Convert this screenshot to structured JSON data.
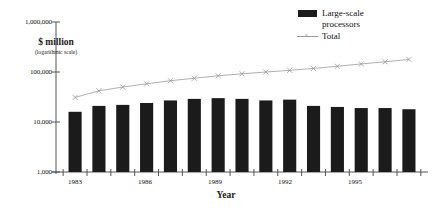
{
  "chart_data": {
    "type": "bar",
    "title": "",
    "xlabel": "Year",
    "ylabel": "$ million",
    "ylabel_note": "(logarithmic scale)",
    "scale": "logarithmic",
    "ylim": [
      1000,
      1000000
    ],
    "ytick_labels": [
      "1,000,000",
      "100,000",
      "10,000",
      "1,000"
    ],
    "ytick_values": [
      1000000,
      100000,
      10000,
      1000
    ],
    "grid": false,
    "legend_position": "top-right",
    "categories": [
      "1983",
      "1984",
      "1985",
      "1986",
      "1987",
      "1988",
      "1989",
      "1990",
      "1991",
      "1992",
      "1993",
      "1994",
      "1995",
      "1996",
      "1997"
    ],
    "xtick_labels": [
      "1983",
      "1986",
      "1989",
      "1992",
      "1995"
    ],
    "series": [
      {
        "name": "Large-scale processors",
        "type": "bar",
        "color": "#1b1b1b",
        "values": [
          16000,
          21000,
          22000,
          24000,
          27000,
          29000,
          30000,
          29000,
          27000,
          28000,
          21000,
          20000,
          19000,
          19000,
          18000
        ]
      },
      {
        "name": "Total",
        "type": "line",
        "color": "#9a9a9a",
        "marker": "x",
        "values": [
          31000,
          42000,
          50000,
          58000,
          67000,
          75000,
          84000,
          92000,
          100000,
          108000,
          118000,
          130000,
          145000,
          160000,
          178000
        ]
      }
    ]
  },
  "legend": {
    "items": [
      {
        "label_line1": "Large-scale",
        "label_line2": "processors",
        "swatch": "bar"
      },
      {
        "label_line1": "Total",
        "label_line2": "",
        "swatch": "line-marker"
      }
    ]
  }
}
